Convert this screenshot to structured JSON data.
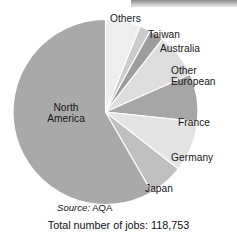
{
  "figure": {
    "source_note_prefix": "Source:",
    "source_note_value": "AQA",
    "total_note": "Total number of jobs: 118,753"
  },
  "chart_data": {
    "type": "pie",
    "title": "",
    "subtitle": "",
    "xlabel": "",
    "ylabel": "",
    "total_label": "Total number of jobs: 118,753",
    "total_value": 118753,
    "source": "Source: AQA",
    "legend": "none (slices labelled directly)",
    "grid": false,
    "start_angle_deg": 0,
    "direction": "clockwise",
    "categories": [
      "Others",
      "Taiwan",
      "Australia",
      "Other European",
      "France",
      "Germany",
      "Japan",
      "North America"
    ],
    "values": [
      6.1,
      1.9,
      2.5,
      7.8,
      8.3,
      8.9,
      6.1,
      58.4
    ],
    "units": "percent",
    "slices": [
      {
        "label": "Others",
        "percent": 6.1,
        "jobs": 7244,
        "angle_deg": 22,
        "color": "#eeeeee"
      },
      {
        "label": "Taiwan",
        "percent": 1.9,
        "jobs": 2256,
        "angle_deg": 7,
        "color": "#cccccc"
      },
      {
        "label": "Australia",
        "percent": 2.5,
        "jobs": 2969,
        "angle_deg": 9,
        "color": "#9d9d9d"
      },
      {
        "label": "Other European",
        "percent": 7.8,
        "jobs": 9263,
        "angle_deg": 28,
        "color": "#dddddd"
      },
      {
        "label": "France",
        "percent": 8.3,
        "jobs": 9856,
        "angle_deg": 30,
        "color": "#a6a6a6"
      },
      {
        "label": "Germany",
        "percent": 8.9,
        "jobs": 10569,
        "angle_deg": 32,
        "color": "#e3e3e3"
      },
      {
        "label": "Japan",
        "percent": 6.1,
        "jobs": 7244,
        "angle_deg": 22,
        "color": "#bfbfbf"
      },
      {
        "label": "North America",
        "percent": 58.4,
        "jobs": 69352,
        "angle_deg": 210,
        "color": "#a9a9a9"
      }
    ],
    "labels": {
      "north_america_line1": "North",
      "north_america_line2": "America",
      "others": "Others",
      "taiwan": "Taiwan",
      "australia": "Australia",
      "other_european_line1": "Other",
      "other_european_line2": "European",
      "france": "France",
      "germany": "Germany",
      "japan": "Japan"
    }
  },
  "colors": {
    "north_america": "#a9a9a9",
    "others": "#eeeeee",
    "taiwan": "#cccccc",
    "australia": "#9d9d9d",
    "other_european": "#dddddd",
    "france": "#a6a6a6",
    "germany": "#e3e3e3",
    "japan": "#bfbfbf",
    "slice_outline": "#ffffff",
    "text": "#161616"
  }
}
